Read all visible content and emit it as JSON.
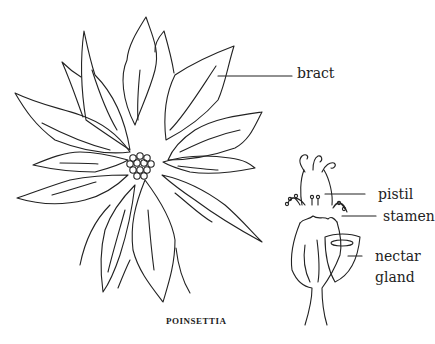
{
  "title": "POINSETTIA",
  "labels": {
    "bract": "bract",
    "pistil": "pistil",
    "stamen": "stamen",
    "nectar_gland_line1": "nectar",
    "nectar_gland_line2": "gland"
  },
  "colors": {
    "ink": "#222222",
    "background": "#ffffff"
  }
}
